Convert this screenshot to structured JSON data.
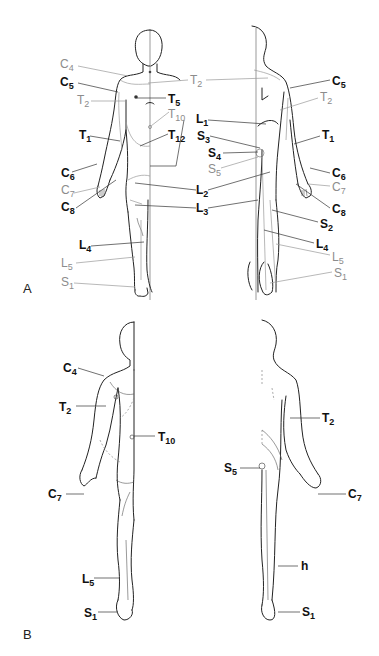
{
  "panels": [
    {
      "id": "A",
      "label": "A"
    },
    {
      "id": "B",
      "label": "B"
    }
  ],
  "colors": {
    "black_label": "#111111",
    "gray_label": "#8c8c8c",
    "outline": "#222222"
  },
  "panel_a": {
    "front_labels": [
      {
        "root": "C",
        "sub": "4",
        "tone": "gray"
      },
      {
        "root": "C",
        "sub": "5",
        "tone": "black"
      },
      {
        "root": "T",
        "sub": "2",
        "tone": "gray"
      },
      {
        "root": "T",
        "sub": "5",
        "tone": "black"
      },
      {
        "root": "T",
        "sub": "10",
        "tone": "gray"
      },
      {
        "root": "T",
        "sub": "1",
        "tone": "black"
      },
      {
        "root": "T",
        "sub": "12",
        "tone": "black"
      },
      {
        "root": "C",
        "sub": "6",
        "tone": "black"
      },
      {
        "root": "C",
        "sub": "7",
        "tone": "gray"
      },
      {
        "root": "C",
        "sub": "8",
        "tone": "black"
      },
      {
        "root": "L",
        "sub": "4",
        "tone": "black"
      },
      {
        "root": "L",
        "sub": "5",
        "tone": "gray"
      },
      {
        "root": "S",
        "sub": "1",
        "tone": "gray"
      }
    ],
    "center_labels": [
      {
        "root": "T",
        "sub": "2",
        "tone": "gray"
      },
      {
        "root": "L",
        "sub": "1",
        "tone": "black"
      },
      {
        "root": "S",
        "sub": "3",
        "tone": "black"
      },
      {
        "root": "S",
        "sub": "4",
        "tone": "black"
      },
      {
        "root": "S",
        "sub": "5",
        "tone": "gray"
      },
      {
        "root": "L",
        "sub": "2",
        "tone": "black"
      },
      {
        "root": "L",
        "sub": "3",
        "tone": "black"
      }
    ],
    "back_labels": [
      {
        "root": "C",
        "sub": "5",
        "tone": "black"
      },
      {
        "root": "T",
        "sub": "2",
        "tone": "gray"
      },
      {
        "root": "T",
        "sub": "1",
        "tone": "black"
      },
      {
        "root": "C",
        "sub": "6",
        "tone": "black"
      },
      {
        "root": "C",
        "sub": "7",
        "tone": "gray"
      },
      {
        "root": "C",
        "sub": "8",
        "tone": "black"
      },
      {
        "root": "S",
        "sub": "2",
        "tone": "black"
      },
      {
        "root": "L",
        "sub": "4",
        "tone": "black"
      },
      {
        "root": "L",
        "sub": "5",
        "tone": "gray"
      },
      {
        "root": "S",
        "sub": "1",
        "tone": "gray"
      }
    ]
  },
  "panel_b": {
    "front_labels": [
      {
        "root": "C",
        "sub": "4",
        "tone": "black"
      },
      {
        "root": "T",
        "sub": "2",
        "tone": "black"
      },
      {
        "root": "T",
        "sub": "10",
        "tone": "black"
      },
      {
        "root": "C",
        "sub": "7",
        "tone": "black"
      },
      {
        "root": "L",
        "sub": "5",
        "tone": "black"
      },
      {
        "root": "S",
        "sub": "1",
        "tone": "black"
      }
    ],
    "back_labels": [
      {
        "root": "T",
        "sub": "2",
        "tone": "black"
      },
      {
        "root": "S",
        "sub": "5",
        "tone": "black"
      },
      {
        "root": "C",
        "sub": "7",
        "tone": "black"
      },
      {
        "root": "h",
        "sub": "",
        "tone": "black"
      },
      {
        "root": "S",
        "sub": "1",
        "tone": "black"
      }
    ]
  }
}
